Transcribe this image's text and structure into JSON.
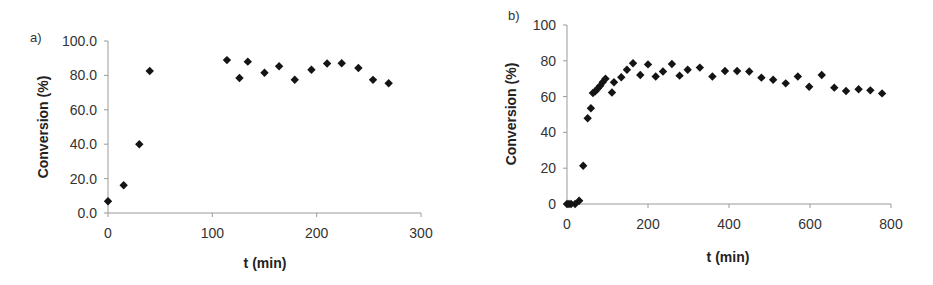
{
  "chart_data": [
    {
      "type": "scatter",
      "panel_label": "a)",
      "title": "",
      "xlabel": "t (min)",
      "ylabel": "Conversion (%)",
      "xlim": [
        0,
        300
      ],
      "ylim": [
        0,
        100
      ],
      "xticks": [
        0,
        100,
        200,
        300
      ],
      "xtick_labels": [
        "0",
        "100",
        "200",
        "300"
      ],
      "yticks": [
        0,
        20,
        40,
        60,
        80,
        100
      ],
      "ytick_labels": [
        "0.0",
        "20.0",
        "40.0",
        "60.0",
        "80.0",
        "100.0"
      ],
      "grid": false,
      "legend": null,
      "marker": "diamond",
      "marker_color": "#141414",
      "series": [
        {
          "name": "Conversion",
          "x": [
            0,
            15,
            30,
            40,
            114,
            126,
            134,
            150,
            164,
            179,
            195,
            210,
            224,
            240,
            254,
            269
          ],
          "y": [
            6.8,
            16.1,
            40.0,
            82.6,
            88.9,
            78.5,
            88.0,
            81.5,
            85.3,
            77.5,
            83.3,
            86.9,
            87.1,
            84.3,
            77.4,
            75.4
          ]
        }
      ]
    },
    {
      "type": "scatter",
      "panel_label": "b)",
      "title": "",
      "xlabel": "t (min)",
      "ylabel": "Conversion (%)",
      "xlim": [
        0,
        800
      ],
      "ylim": [
        0,
        100
      ],
      "xticks": [
        0,
        200,
        400,
        600,
        800
      ],
      "xtick_labels": [
        "0",
        "200",
        "400",
        "600",
        "800"
      ],
      "yticks": [
        0,
        20,
        40,
        60,
        80,
        100
      ],
      "ytick_labels": [
        "0",
        "20",
        "40",
        "60",
        "80",
        "100"
      ],
      "grid": false,
      "legend": null,
      "marker": "diamond",
      "marker_color": "#141414",
      "series": [
        {
          "name": "Conversion",
          "x": [
            0,
            5,
            10,
            20,
            30,
            40,
            51,
            59,
            64,
            70,
            76,
            82,
            88,
            95,
            111,
            116,
            134,
            148,
            163,
            181,
            200,
            219,
            237,
            259,
            278,
            298,
            328,
            359,
            390,
            420,
            450,
            480,
            509,
            540,
            570,
            598,
            629,
            660,
            689,
            720,
            749,
            778
          ],
          "y": [
            0,
            0,
            0,
            0,
            1.8,
            21.4,
            47.9,
            53.5,
            62.0,
            63.0,
            64.5,
            66.0,
            68.0,
            70.0,
            62.3,
            68.0,
            70.8,
            75.0,
            78.6,
            72.1,
            78.0,
            71.2,
            74.0,
            78.2,
            71.7,
            75.0,
            76.2,
            71.2,
            74.3,
            74.3,
            74.0,
            70.6,
            69.4,
            67.4,
            71.2,
            65.5,
            72.1,
            65.0,
            63.1,
            64.1,
            63.5,
            61.8
          ]
        }
      ]
    }
  ],
  "charts": {
    "a": {
      "panel_label": "a)",
      "xlabel": "t (min)",
      "ylabel": "Conversion (%)",
      "xtick_labels": [
        "0",
        "100",
        "200",
        "300"
      ],
      "ytick_labels": [
        "0.0",
        "20.0",
        "40.0",
        "60.0",
        "80.0",
        "100.0"
      ]
    },
    "b": {
      "panel_label": "b)",
      "xlabel": "t (min)",
      "ylabel": "Conversion (%)",
      "xtick_labels": [
        "0",
        "200",
        "400",
        "600",
        "800"
      ],
      "ytick_labels": [
        "0",
        "20",
        "40",
        "60",
        "80",
        "100"
      ]
    }
  }
}
